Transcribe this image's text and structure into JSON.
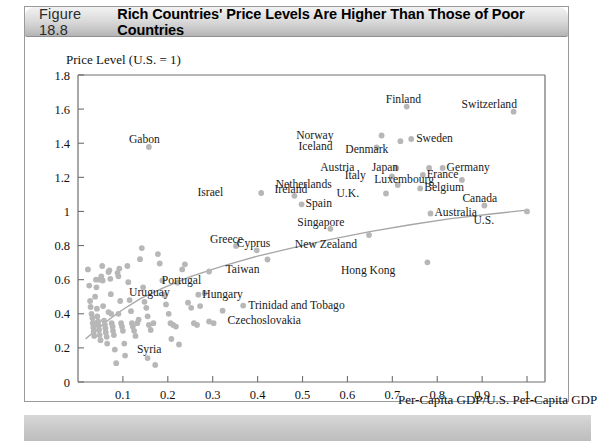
{
  "figure": {
    "number": "Figure 18.8",
    "title": "Rich Countries' Price Levels Are Higher Than Those of Poor Countries"
  },
  "chart_data": {
    "type": "scatter",
    "title": "Rich Countries' Price Levels Are Higher Than Those of Poor Countries",
    "xlabel": "Per-Capita GDP/U.S. Per-Capita GDP",
    "ylabel": "Price Level (U.S. = 1)",
    "xlim": [
      0,
      1.04
    ],
    "ylim": [
      0,
      1.8
    ],
    "xticks": [
      "0.1",
      "0.2",
      "0.3",
      "0.4",
      "0.5",
      "0.6",
      "0.7",
      "0.8",
      "0.9",
      "1"
    ],
    "xtick_values": [
      0.1,
      0.2,
      0.3,
      0.4,
      0.5,
      0.6,
      0.7,
      0.8,
      0.9,
      1.0
    ],
    "yticks": [
      "0",
      "0.2",
      "0.4",
      "0.6",
      "0.8",
      "1",
      "1.2",
      "1.4",
      "1.6",
      "1.8"
    ],
    "ytick_values": [
      0,
      0.2,
      0.4,
      0.6,
      0.8,
      1.0,
      1.2,
      1.4,
      1.6,
      1.8
    ],
    "grid": false,
    "legend": null,
    "marker_color": "#b7b7b7",
    "trend_color": "#a6a6a6",
    "axis_color": "#6e6e6e",
    "labeled_points": [
      {
        "name": "Switzerland",
        "x": 0.97,
        "y": 1.585,
        "lx": -52,
        "ly": -13
      },
      {
        "name": "Finland",
        "x": 0.732,
        "y": 1.615,
        "lx": -21,
        "ly": -13
      },
      {
        "name": "Norway",
        "x": 0.676,
        "y": 1.445,
        "lx": -48,
        "ly": -6
      },
      {
        "name": "Sweden",
        "x": 0.742,
        "y": 1.425,
        "lx": 5,
        "ly": -6
      },
      {
        "name": "Iceland",
        "x": 0.665,
        "y": 1.375,
        "lx": -44,
        "ly": -6
      },
      {
        "name": "Denmark",
        "x": 0.718,
        "y": 1.412,
        "lx": -12,
        "ly": 3
      },
      {
        "name": "Japan",
        "x": 0.782,
        "y": 1.255,
        "lx": -31,
        "ly": -6
      },
      {
        "name": "Germany",
        "x": 0.812,
        "y": 1.255,
        "lx": 4,
        "ly": -6
      },
      {
        "name": "Austria",
        "x": 0.709,
        "y": 1.255,
        "lx": -42,
        "ly": -6
      },
      {
        "name": "France",
        "x": 0.768,
        "y": 1.215,
        "lx": 4,
        "ly": -6
      },
      {
        "name": "Luxembourg",
        "x": 0.855,
        "y": 1.185,
        "lx": -28,
        "ly": -6
      },
      {
        "name": "Italy",
        "x": 0.699,
        "y": 1.205,
        "lx": -26,
        "ly": -6
      },
      {
        "name": "Netherlands",
        "x": 0.712,
        "y": 1.155,
        "lx": -66,
        "ly": -6
      },
      {
        "name": "Belgium",
        "x": 0.762,
        "y": 1.135,
        "lx": 4,
        "ly": -6
      },
      {
        "name": "U.K.",
        "x": 0.686,
        "y": 1.105,
        "lx": -27,
        "ly": -6
      },
      {
        "name": "Ireland",
        "x": 0.482,
        "y": 1.092,
        "lx": -20,
        "ly": -12
      },
      {
        "name": "Israel",
        "x": 0.408,
        "y": 1.108,
        "lx": -38,
        "ly": -6
      },
      {
        "name": "Spain",
        "x": 0.498,
        "y": 1.042,
        "lx": 4,
        "ly": -6
      },
      {
        "name": "Canada",
        "x": 0.905,
        "y": 1.035,
        "lx": -22,
        "ly": -12
      },
      {
        "name": "Australia",
        "x": 0.785,
        "y": 0.988,
        "lx": 4,
        "ly": -6
      },
      {
        "name": "U.S.",
        "x": 1.0,
        "y": 1.0,
        "lx": -33,
        "ly": 4
      },
      {
        "name": "Singapore",
        "x": 0.562,
        "y": 0.898,
        "lx": -33,
        "ly": -12
      },
      {
        "name": "New Zealand",
        "x": 0.648,
        "y": 0.862,
        "lx": -12,
        "ly": 4
      },
      {
        "name": "Greece",
        "x": 0.352,
        "y": 0.798,
        "lx": -26,
        "ly": -12
      },
      {
        "name": "Cyprus",
        "x": 0.398,
        "y": 0.772,
        "lx": -20,
        "ly": -12
      },
      {
        "name": "Hong Kong",
        "x": 0.778,
        "y": 0.702,
        "lx": -32,
        "ly": 3
      },
      {
        "name": "Taiwan",
        "x": 0.422,
        "y": 0.718,
        "lx": -8,
        "ly": 4
      },
      {
        "name": "Portugal",
        "x": 0.292,
        "y": 0.648,
        "lx": -8,
        "ly": 4
      },
      {
        "name": "Uruguay",
        "x": 0.222,
        "y": 0.582,
        "lx": -8,
        "ly": 4
      },
      {
        "name": "Hungary",
        "x": 0.268,
        "y": 0.512,
        "lx": 4,
        "ly": -6
      },
      {
        "name": "Trinidad and Tobago",
        "x": 0.368,
        "y": 0.448,
        "lx": 5,
        "ly": -6
      },
      {
        "name": "Czechoslovakia",
        "x": 0.322,
        "y": 0.418,
        "lx": 5,
        "ly": 4
      },
      {
        "name": "Syria",
        "x": 0.208,
        "y": 0.252,
        "lx": -10,
        "ly": 5
      },
      {
        "name": "Gabon",
        "x": 0.158,
        "y": 1.378,
        "lx": -20,
        "ly": -13
      }
    ],
    "unlabeled_points": [
      [
        0.022,
        0.66
      ],
      [
        0.025,
        0.565
      ],
      [
        0.027,
        0.475
      ],
      [
        0.028,
        0.44
      ],
      [
        0.03,
        0.4
      ],
      [
        0.032,
        0.375
      ],
      [
        0.033,
        0.345
      ],
      [
        0.034,
        0.32
      ],
      [
        0.035,
        0.295
      ],
      [
        0.036,
        0.27
      ],
      [
        0.038,
        0.5
      ],
      [
        0.04,
        0.6
      ],
      [
        0.041,
        0.555
      ],
      [
        0.042,
        0.43
      ],
      [
        0.043,
        0.385
      ],
      [
        0.045,
        0.355
      ],
      [
        0.046,
        0.33
      ],
      [
        0.047,
        0.305
      ],
      [
        0.048,
        0.275
      ],
      [
        0.05,
        0.245
      ],
      [
        0.052,
        0.62
      ],
      [
        0.054,
        0.68
      ],
      [
        0.055,
        0.595
      ],
      [
        0.056,
        0.445
      ],
      [
        0.058,
        0.36
      ],
      [
        0.06,
        0.335
      ],
      [
        0.061,
        0.315
      ],
      [
        0.062,
        0.29
      ],
      [
        0.064,
        0.265
      ],
      [
        0.065,
        0.225
      ],
      [
        0.068,
        0.645
      ],
      [
        0.07,
        0.655
      ],
      [
        0.072,
        0.605
      ],
      [
        0.073,
        0.515
      ],
      [
        0.074,
        0.4
      ],
      [
        0.075,
        0.345
      ],
      [
        0.077,
        0.325
      ],
      [
        0.078,
        0.3
      ],
      [
        0.08,
        0.275
      ],
      [
        0.082,
        0.19
      ],
      [
        0.085,
        0.11
      ],
      [
        0.088,
        0.64
      ],
      [
        0.09,
        0.62
      ],
      [
        0.092,
        0.665
      ],
      [
        0.094,
        0.475
      ],
      [
        0.096,
        0.345
      ],
      [
        0.098,
        0.325
      ],
      [
        0.1,
        0.3
      ],
      [
        0.103,
        0.225
      ],
      [
        0.105,
        0.155
      ],
      [
        0.11,
        0.68
      ],
      [
        0.112,
        0.585
      ],
      [
        0.115,
        0.48
      ],
      [
        0.118,
        0.415
      ],
      [
        0.12,
        0.345
      ],
      [
        0.122,
        0.325
      ],
      [
        0.125,
        0.3
      ],
      [
        0.128,
        0.27
      ],
      [
        0.132,
        0.345
      ],
      [
        0.135,
        0.365
      ],
      [
        0.138,
        0.72
      ],
      [
        0.142,
        0.785
      ],
      [
        0.145,
        0.555
      ],
      [
        0.148,
        0.47
      ],
      [
        0.152,
        0.435
      ],
      [
        0.155,
        0.385
      ],
      [
        0.158,
        0.335
      ],
      [
        0.162,
        0.305
      ],
      [
        0.168,
        0.345
      ],
      [
        0.172,
        0.1
      ],
      [
        0.178,
        0.75
      ],
      [
        0.182,
        0.695
      ],
      [
        0.188,
        0.595
      ],
      [
        0.192,
        0.51
      ],
      [
        0.196,
        0.455
      ],
      [
        0.202,
        0.4
      ],
      [
        0.206,
        0.345
      ],
      [
        0.212,
        0.335
      ],
      [
        0.218,
        0.325
      ],
      [
        0.225,
        0.22
      ],
      [
        0.232,
        0.66
      ],
      [
        0.238,
        0.69
      ],
      [
        0.245,
        0.465
      ],
      [
        0.252,
        0.435
      ],
      [
        0.258,
        0.345
      ],
      [
        0.265,
        0.335
      ],
      [
        0.272,
        0.445
      ],
      [
        0.282,
        0.52
      ],
      [
        0.292,
        0.355
      ],
      [
        0.302,
        0.345
      ],
      [
        0.155,
        0.14
      ],
      [
        0.048,
        0.6
      ],
      [
        0.039,
        0.345
      ],
      [
        0.068,
        0.41
      ],
      [
        0.09,
        0.4
      ]
    ],
    "trend_curve": [
      [
        0.018,
        0.255
      ],
      [
        0.04,
        0.305
      ],
      [
        0.07,
        0.368
      ],
      [
        0.1,
        0.425
      ],
      [
        0.14,
        0.49
      ],
      [
        0.19,
        0.552
      ],
      [
        0.25,
        0.618
      ],
      [
        0.32,
        0.678
      ],
      [
        0.4,
        0.738
      ],
      [
        0.48,
        0.788
      ],
      [
        0.56,
        0.835
      ],
      [
        0.65,
        0.882
      ],
      [
        0.74,
        0.922
      ],
      [
        0.83,
        0.958
      ],
      [
        0.92,
        0.985
      ],
      [
        1.0,
        1.008
      ]
    ]
  }
}
